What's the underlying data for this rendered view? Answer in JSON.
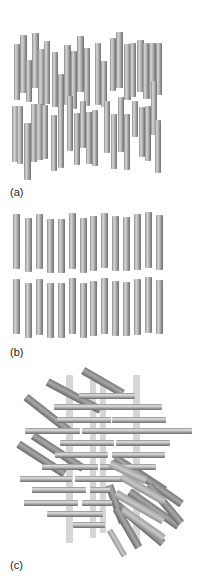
{
  "figure": {
    "labels": {
      "a": "(a)",
      "b": "(b)",
      "c": "(c)"
    },
    "colors": {
      "rod_dark": "#6e6e6e",
      "rod_light": "#d8d8d8",
      "background": "#ffffff"
    }
  },
  "panel_a": {
    "description": "nematic-like vertical rods, random vertical offsets",
    "rods": [
      [
        14,
        44,
        6,
        56
      ],
      [
        20,
        35,
        7,
        58
      ],
      [
        26,
        60,
        6,
        42
      ],
      [
        32,
        33,
        7,
        55
      ],
      [
        38,
        49,
        7,
        62
      ],
      [
        44,
        41,
        6,
        63
      ],
      [
        52,
        52,
        6,
        55
      ],
      [
        58,
        74,
        6,
        46
      ],
      [
        64,
        45,
        7,
        60
      ],
      [
        71,
        51,
        6,
        58
      ],
      [
        77,
        36,
        7,
        56
      ],
      [
        84,
        48,
        6,
        58
      ],
      [
        95,
        43,
        6,
        62
      ],
      [
        101,
        61,
        6,
        46
      ],
      [
        110,
        38,
        6,
        53
      ],
      [
        116,
        32,
        7,
        56
      ],
      [
        124,
        44,
        7,
        56
      ],
      [
        130,
        43,
        6,
        54
      ],
      [
        137,
        40,
        7,
        52
      ],
      [
        143,
        43,
        6,
        56
      ],
      [
        149,
        43,
        7,
        56
      ],
      [
        156,
        43,
        6,
        52
      ],
      [
        12,
        106,
        7,
        56
      ],
      [
        17,
        106,
        6,
        58
      ],
      [
        24,
        123,
        7,
        57
      ],
      [
        31,
        104,
        6,
        58
      ],
      [
        36,
        104,
        7,
        56
      ],
      [
        42,
        105,
        6,
        54
      ],
      [
        51,
        115,
        6,
        56
      ],
      [
        58,
        110,
        6,
        58
      ],
      [
        67,
        96,
        6,
        55
      ],
      [
        74,
        113,
        6,
        52
      ],
      [
        80,
        101,
        6,
        47
      ],
      [
        86,
        112,
        6,
        52
      ],
      [
        92,
        110,
        6,
        56
      ],
      [
        104,
        101,
        6,
        52
      ],
      [
        111,
        114,
        6,
        55
      ],
      [
        118,
        97,
        6,
        55
      ],
      [
        124,
        114,
        6,
        56
      ],
      [
        132,
        101,
        6,
        36
      ],
      [
        139,
        107,
        6,
        50
      ],
      [
        145,
        106,
        6,
        55
      ],
      [
        151,
        81,
        6,
        54
      ],
      [
        155,
        120,
        6,
        53
      ]
    ]
  },
  "panel_b": {
    "description": "smectic layered vertical rods, two rows of 14",
    "row_top": [
      [
        13,
        214,
        7,
        55
      ],
      [
        25,
        218,
        7,
        54
      ],
      [
        36,
        214,
        7,
        55
      ],
      [
        47,
        219,
        7,
        54
      ],
      [
        58,
        219,
        7,
        54
      ],
      [
        69,
        213,
        7,
        56
      ],
      [
        80,
        218,
        7,
        55
      ],
      [
        90,
        216,
        7,
        55
      ],
      [
        101,
        213,
        7,
        55
      ],
      [
        112,
        216,
        7,
        55
      ],
      [
        123,
        217,
        7,
        54
      ],
      [
        134,
        214,
        7,
        56
      ],
      [
        145,
        212,
        7,
        56
      ],
      [
        156,
        215,
        7,
        55
      ]
    ],
    "row_bottom": [
      [
        13,
        279,
        7,
        55
      ],
      [
        25,
        283,
        7,
        55
      ],
      [
        36,
        279,
        7,
        56
      ],
      [
        47,
        283,
        7,
        55
      ],
      [
        58,
        283,
        7,
        55
      ],
      [
        69,
        278,
        7,
        56
      ],
      [
        80,
        283,
        7,
        55
      ],
      [
        90,
        281,
        7,
        55
      ],
      [
        101,
        278,
        7,
        56
      ],
      [
        112,
        281,
        7,
        55
      ],
      [
        123,
        282,
        7,
        54
      ],
      [
        134,
        279,
        7,
        56
      ],
      [
        145,
        277,
        7,
        56
      ],
      [
        156,
        280,
        7,
        54
      ]
    ]
  },
  "panel_c": {
    "description": "cholesteric / twisted stacked layers",
    "ghost_vertical": [
      [
        66,
        375,
        7,
        168
      ],
      [
        133,
        375,
        7,
        168
      ],
      [
        90,
        380,
        6,
        158
      ],
      [
        100,
        383,
        6,
        150
      ]
    ],
    "tilted_back": [
      [
        80,
        378,
        46,
        8,
        30
      ],
      [
        44,
        392,
        60,
        8,
        28
      ],
      [
        20,
        410,
        55,
        8,
        38
      ],
      [
        28,
        448,
        60,
        8,
        33
      ],
      [
        14,
        455,
        55,
        8,
        33
      ],
      [
        110,
        470,
        60,
        8,
        33
      ],
      [
        118,
        480,
        70,
        8,
        35
      ],
      [
        124,
        505,
        60,
        8,
        35
      ],
      [
        110,
        520,
        60,
        8,
        40
      ],
      [
        140,
        500,
        50,
        8,
        50
      ],
      [
        96,
        500,
        40,
        8,
        70
      ],
      [
        105,
        524,
        45,
        8,
        60
      ]
    ],
    "horizontal": [
      [
        79,
        393,
        56,
        6
      ],
      [
        54,
        404,
        54,
        6
      ],
      [
        108,
        404,
        54,
        6
      ],
      [
        57,
        417,
        54,
        6
      ],
      [
        112,
        417,
        54,
        6
      ],
      [
        25,
        428,
        55,
        6
      ],
      [
        82,
        428,
        55,
        6
      ],
      [
        137,
        428,
        55,
        6
      ],
      [
        60,
        440,
        54,
        6
      ],
      [
        116,
        440,
        54,
        6
      ],
      [
        55,
        452,
        53,
        6
      ],
      [
        112,
        452,
        53,
        6
      ],
      [
        42,
        464,
        56,
        6
      ],
      [
        100,
        464,
        56,
        6
      ],
      [
        20,
        476,
        52,
        6
      ],
      [
        75,
        476,
        52,
        6
      ],
      [
        32,
        487,
        54,
        6
      ],
      [
        90,
        487,
        20,
        6
      ],
      [
        24,
        500,
        54,
        6
      ],
      [
        82,
        500,
        30,
        6
      ],
      [
        47,
        511,
        56,
        6
      ],
      [
        73,
        522,
        32,
        6
      ]
    ],
    "tilted_front": [
      [
        108,
        468,
        40,
        8,
        25
      ],
      [
        118,
        485,
        50,
        8,
        30
      ],
      [
        112,
        503,
        55,
        8,
        30
      ],
      [
        118,
        520,
        50,
        8,
        35
      ],
      [
        102,
        540,
        30,
        6,
        60
      ]
    ]
  }
}
